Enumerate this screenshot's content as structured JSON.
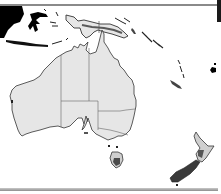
{
  "map": {
    "title": "Australia and Oceania region map",
    "regions": [
      {
        "name": "Western Australia",
        "type": "state"
      },
      {
        "name": "Northern Territory",
        "type": "territory"
      },
      {
        "name": "South Australia",
        "type": "state"
      },
      {
        "name": "Queensland",
        "type": "state"
      },
      {
        "name": "New South Wales",
        "type": "state"
      },
      {
        "name": "Victoria",
        "type": "state"
      },
      {
        "name": "Tasmania",
        "type": "state"
      },
      {
        "name": "New Zealand",
        "type": "country"
      },
      {
        "name": "New Guinea",
        "type": "island"
      },
      {
        "name": "Borneo",
        "type": "island"
      },
      {
        "name": "Sulawesi",
        "type": "island"
      },
      {
        "name": "Solomon Islands",
        "type": "islands"
      },
      {
        "name": "Vanuatu",
        "type": "islands"
      },
      {
        "name": "New Caledonia",
        "type": "island"
      },
      {
        "name": "Fiji",
        "type": "islands"
      }
    ],
    "colors": {
      "ocean": "#ffffff",
      "land": "#e6e6e6",
      "border": "#555555",
      "highlight_dark": "#000000",
      "new_zealand": "#3a3a3a",
      "tasmania": "#4a4a4a",
      "new_guinea_band": "#5a5a5a"
    }
  }
}
